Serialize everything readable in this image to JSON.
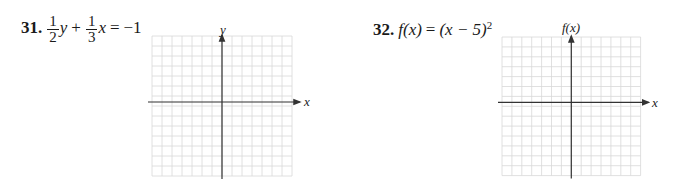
{
  "problems": [
    {
      "number": "31.",
      "equation": {
        "frac1": {
          "num": "1",
          "den": "2"
        },
        "var1": "y",
        "plus": "+",
        "frac2": {
          "num": "1",
          "den": "3"
        },
        "var2": "x",
        "equals": "=",
        "rhs": "−1"
      },
      "graph": {
        "x_label": "x",
        "y_label": "y"
      }
    },
    {
      "number": "32.",
      "equation": {
        "lhs": "f(x)",
        "equals": "=",
        "rhs_base": "(x − 5)",
        "rhs_exp": "2"
      },
      "graph": {
        "x_label": "x",
        "y_label": "f(x)"
      }
    }
  ],
  "grid_style": {
    "grid_color": "#d8d8d8",
    "axis_color": "#333333"
  }
}
